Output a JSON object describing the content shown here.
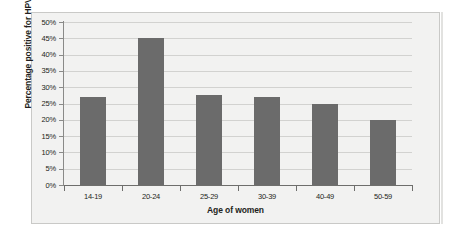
{
  "chart_data": {
    "type": "bar",
    "title": "",
    "xlabel": "Age of women",
    "ylabel": "Percentage positive for HPV",
    "categories": [
      "14-19",
      "20-24",
      "25-29",
      "30-39",
      "40-49",
      "50-59"
    ],
    "values": [
      27,
      45,
      27.5,
      27,
      25,
      20
    ],
    "ylim": [
      0,
      50
    ],
    "ytick_labels": [
      "0%",
      "5%",
      "10%",
      "15%",
      "20%",
      "25%",
      "30%",
      "35%",
      "40%",
      "45%",
      "50%"
    ],
    "ytick_values": [
      0,
      5,
      10,
      15,
      20,
      25,
      30,
      35,
      40,
      45,
      50
    ],
    "grid": true,
    "legend": "none",
    "series": [
      {
        "name": "Percentage positive for HPV",
        "values": [
          27,
          45,
          27.5,
          27,
          25,
          20
        ]
      }
    ],
    "colors": {
      "bar_fill": "#6b6b6b",
      "plot_background": "#f2f2f1",
      "gridline": "#d2d2d0",
      "axis_line": "#6e6e6c",
      "text": "#231f20",
      "frame_border": "#c9c9c7"
    }
  }
}
